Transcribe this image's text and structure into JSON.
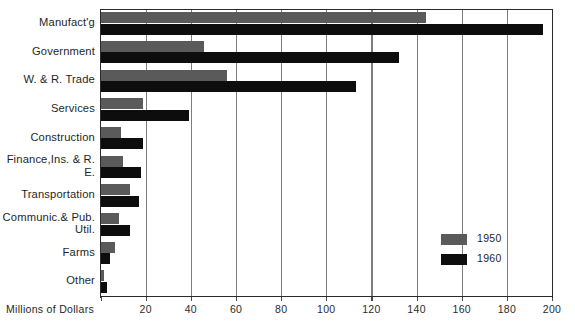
{
  "chart_data": {
    "type": "bar",
    "orientation": "horizontal",
    "title": "",
    "xlabel": "Millions of Dollars",
    "ylabel": "",
    "xlim": [
      0,
      200
    ],
    "xticks": [
      0,
      20,
      40,
      60,
      80,
      100,
      120,
      140,
      160,
      180,
      200
    ],
    "xtick_labels": [
      "",
      "20",
      "40",
      "60",
      "80",
      "100",
      "120",
      "140",
      "160",
      "180",
      "200"
    ],
    "grid": "vertical",
    "legend_position": "inside-right",
    "categories": [
      "Manufact'g",
      "Government",
      "W. & R. Trade",
      "Services",
      "Construction",
      "Finance,\nIns. & R. E.",
      "Transportation",
      "Communic.\n& Pub. Util.",
      "Farms",
      "Other"
    ],
    "category_lines": [
      [
        "Manufact'g"
      ],
      [
        "Government"
      ],
      [
        "W. & R. Trade"
      ],
      [
        "Services"
      ],
      [
        "Construction"
      ],
      [
        "Finance,",
        "Ins. & R. E."
      ],
      [
        "Transportation"
      ],
      [
        "Communic.",
        "& Pub. Util."
      ],
      [
        "Farms"
      ],
      [
        "Other"
      ]
    ],
    "series": [
      {
        "name": "1950",
        "color": "#5a5a5a",
        "values": [
          144,
          46,
          56,
          19,
          9,
          10,
          13,
          8,
          6.5,
          1.5
        ]
      },
      {
        "name": "1960",
        "color": "#0d0d0d",
        "values": [
          196,
          132,
          113,
          39,
          19,
          18,
          17,
          13,
          4,
          3
        ]
      }
    ]
  },
  "legend": {
    "items": [
      {
        "label": "1950",
        "color": "#5a5a5a"
      },
      {
        "label": "1960",
        "color": "#0d0d0d"
      }
    ]
  },
  "axis": {
    "title": "Millions of Dollars"
  }
}
